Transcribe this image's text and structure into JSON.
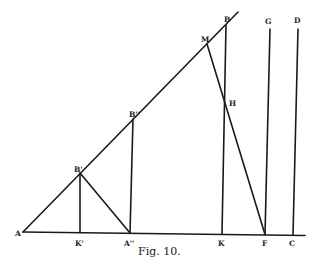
{
  "figure": {
    "caption": "Fig. 10.",
    "points": {
      "A": "A",
      "K1": "K'",
      "A2": "A''",
      "K": "K",
      "F": "F",
      "C": "C",
      "B1": "B'",
      "B2": "B''",
      "M": "M",
      "B": "B",
      "H": "H",
      "G": "G",
      "D": "D"
    }
  }
}
